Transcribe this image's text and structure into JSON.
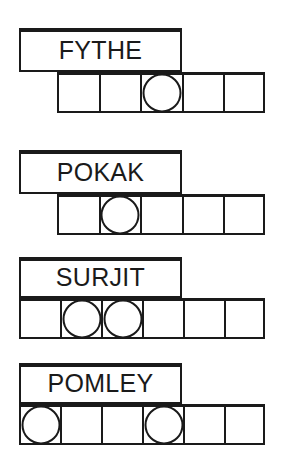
{
  "worksheet": {
    "title": "Name Letter Grid Worksheet",
    "ink_color": "#1a1a1a",
    "paper_color": "#ffffff",
    "rows": [
      {
        "name": "FYTHE",
        "letter_count": 5,
        "cell_count": 5,
        "grid_offset_cells": 1,
        "circled_cell_indexes": [
          2
        ],
        "circled_positions_human": "3rd",
        "label_box": {
          "left": 19,
          "top": 28,
          "width": 163,
          "height": 44
        },
        "grid": {
          "left": 57,
          "top": 72,
          "cell_width": 41.6,
          "cell_height": 41
        }
      },
      {
        "name": "POKAK",
        "letter_count": 5,
        "cell_count": 5,
        "grid_offset_cells": 1,
        "circled_cell_indexes": [
          1
        ],
        "circled_positions_human": "2nd",
        "label_box": {
          "left": 19,
          "top": 150,
          "width": 163,
          "height": 44
        },
        "grid": {
          "left": 57,
          "top": 194,
          "cell_width": 41.6,
          "cell_height": 41
        }
      },
      {
        "name": "SURJIT",
        "letter_count": 6,
        "cell_count": 6,
        "grid_offset_cells": 0,
        "circled_cell_indexes": [
          1,
          2
        ],
        "circled_positions_human": "2nd and 3rd",
        "label_box": {
          "left": 19,
          "top": 257,
          "width": 163,
          "height": 41
        },
        "grid": {
          "left": 19,
          "top": 298,
          "cell_width": 41.0,
          "cell_height": 41
        }
      },
      {
        "name": "POMLEY",
        "letter_count": 6,
        "cell_count": 6,
        "grid_offset_cells": 0,
        "circled_cell_indexes": [
          0,
          3
        ],
        "circled_positions_human": "1st and 4th",
        "label_box": {
          "left": 19,
          "top": 363,
          "width": 163,
          "height": 41
        },
        "grid": {
          "left": 19,
          "top": 404,
          "cell_width": 41.0,
          "cell_height": 41
        }
      }
    ]
  }
}
